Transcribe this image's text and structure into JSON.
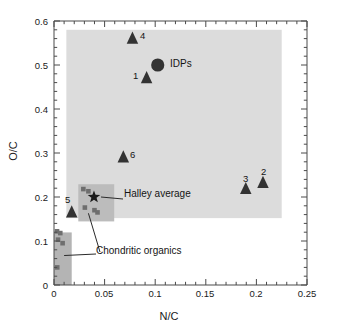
{
  "chart_data": {
    "type": "scatter",
    "title": "",
    "xlabel": "N/C",
    "ylabel": "O/C",
    "xlim": [
      0,
      0.25
    ],
    "ylim": [
      0,
      0.6
    ],
    "xticks": [
      "0",
      "0.05",
      "0.1",
      "0.15",
      "0.2",
      "0.25"
    ],
    "xtick_values": [
      0,
      0.05,
      0.1,
      0.15,
      0.2,
      0.25
    ],
    "yticks": [
      "0",
      "0.1",
      "0.2",
      "0.3",
      "0.4",
      "0.5",
      "0.6"
    ],
    "ytick_values": [
      0,
      0.1,
      0.2,
      0.3,
      0.4,
      0.5,
      0.6
    ],
    "grid": false,
    "legend": "none",
    "minor_ticks": true,
    "series": [
      {
        "name": "particles",
        "marker": "triangle",
        "color": "#333333",
        "points": [
          {
            "label": "1",
            "x": 0.0915,
            "y": 0.47,
            "label_pos": "left"
          },
          {
            "label": "2",
            "x": 0.2065,
            "y": 0.232,
            "label_pos": "top"
          },
          {
            "label": "3",
            "x": 0.1895,
            "y": 0.218,
            "label_pos": "top"
          },
          {
            "label": "4",
            "x": 0.0775,
            "y": 0.56,
            "label_pos": "right"
          },
          {
            "label": "5",
            "x": 0.0175,
            "y": 0.165,
            "label_pos": "topleft"
          },
          {
            "label": "6",
            "x": 0.0685,
            "y": 0.29,
            "label_pos": "right"
          }
        ]
      },
      {
        "name": "IDPs",
        "marker": "circle",
        "color": "#333333",
        "points": [
          {
            "label": "IDPs",
            "x": 0.1025,
            "y": 0.5,
            "label_pos": "right"
          }
        ]
      },
      {
        "name": "Halley average",
        "marker": "star",
        "color": "#1a1a1a",
        "points": [
          {
            "label": "Halley average",
            "x": 0.0395,
            "y": 0.2,
            "label_pos": "right"
          }
        ]
      },
      {
        "name": "Chondritic organics",
        "marker": "square",
        "color": "#6e6e6e",
        "points": [
          {
            "x": 0.003,
            "y": 0.122
          },
          {
            "x": 0.0062,
            "y": 0.118
          },
          {
            "x": 0.004,
            "y": 0.103
          },
          {
            "x": 0.0085,
            "y": 0.095
          },
          {
            "x": 0.0032,
            "y": 0.04
          },
          {
            "x": 0.029,
            "y": 0.218
          },
          {
            "x": 0.034,
            "y": 0.213
          },
          {
            "x": 0.0305,
            "y": 0.176
          },
          {
            "x": 0.04,
            "y": 0.17
          },
          {
            "x": 0.043,
            "y": 0.165
          }
        ]
      }
    ],
    "regions": [
      {
        "name": "cometary-field",
        "color": "#dcdcdc",
        "x0": 0.0122,
        "x1": 0.225,
        "y0": 0.152,
        "y1": 0.58
      },
      {
        "name": "halley-box",
        "color": "#bcbcbc",
        "x0": 0.024,
        "x1": 0.0595,
        "y0": 0.1445,
        "y1": 0.229
      },
      {
        "name": "chondritic-box",
        "color": "#b4b4b4",
        "x0": -0.0045,
        "x1": 0.0175,
        "y0": 0.0,
        "y1": 0.1195
      }
    ],
    "annotations": [
      {
        "name": "halley-average",
        "text": "Halley average"
      },
      {
        "name": "chondritic-organics",
        "text": "Chondritic organics"
      },
      {
        "name": "idps",
        "text": "IDPs"
      }
    ]
  },
  "labels": {
    "xlabel": "N/C",
    "ylabel": "O/C",
    "idps": "IDPs",
    "halley_average": "Halley average",
    "chondritic_organics": "Chondritic organics",
    "p1": "1",
    "p2": "2",
    "p3": "3",
    "p4": "4",
    "p5": "5",
    "p6": "6",
    "xt0": "0",
    "xt1": "0.05",
    "xt2": "0.1",
    "xt3": "0.15",
    "xt4": "0.2",
    "xt5": "0.25",
    "yt0": "0",
    "yt1": "0.1",
    "yt2": "0.2",
    "yt3": "0.3",
    "yt4": "0.4",
    "yt5": "0.5",
    "yt6": "0.6"
  }
}
